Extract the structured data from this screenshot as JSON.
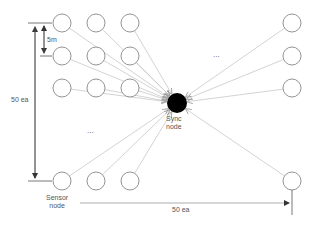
{
  "diagram": {
    "caption_fragment": "",
    "sync_node": {
      "label_line1": "Sync",
      "label_line2": "node",
      "cx": 177,
      "cy": 103,
      "r": 10,
      "fill": "#000000"
    },
    "sensor_node_label": {
      "line1": "Sensor",
      "line2": "node"
    },
    "spacing_label": "5m",
    "vertical_count_label": "50 ea",
    "horizontal_count_label": "50 ea",
    "ellipsis_left": "...",
    "ellipsis_right": "...",
    "sensor_radius": 9,
    "sensor_nodes": [
      {
        "cx": 62,
        "cy": 23
      },
      {
        "cx": 96,
        "cy": 23
      },
      {
        "cx": 130,
        "cy": 23
      },
      {
        "cx": 62,
        "cy": 56
      },
      {
        "cx": 96,
        "cy": 56
      },
      {
        "cx": 130,
        "cy": 56
      },
      {
        "cx": 62,
        "cy": 88
      },
      {
        "cx": 96,
        "cy": 88
      },
      {
        "cx": 130,
        "cy": 88
      },
      {
        "cx": 62,
        "cy": 181
      },
      {
        "cx": 96,
        "cy": 181
      },
      {
        "cx": 130,
        "cy": 181
      },
      {
        "cx": 292,
        "cy": 23
      },
      {
        "cx": 292,
        "cy": 56
      },
      {
        "cx": 292,
        "cy": 88
      },
      {
        "cx": 292,
        "cy": 181
      }
    ],
    "colors": {
      "node_stroke": "#888888",
      "link": "#c8c8c8",
      "dimension": "#555555"
    }
  }
}
